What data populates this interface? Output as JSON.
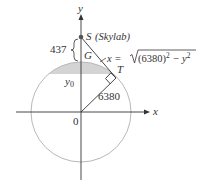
{
  "diagram": {
    "axes": {
      "x_label": "x",
      "y_label": "y",
      "origin_label": "0"
    },
    "point_s": {
      "label": "S",
      "name": "(Skylab)"
    },
    "point_g": {
      "label": "G"
    },
    "point_t": {
      "label": "T"
    },
    "height_label": "437",
    "y0_label": "y",
    "y0_sub": "0",
    "radius_label": "6380",
    "formula": {
      "prefix": "x = ",
      "radical": "(6380)",
      "exp1": "2",
      "minus": " − y",
      "exp2": "2"
    },
    "colors": {
      "circle": "#b8b8b8",
      "cap_fill": "#d4d4d4",
      "lines": "#333333",
      "point": "#555555"
    }
  }
}
